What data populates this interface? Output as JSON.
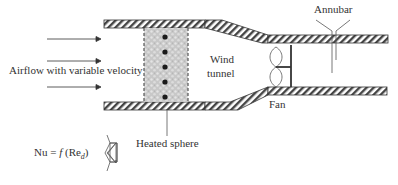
{
  "diagram": {
    "labels": {
      "airflow": "Airflow with variable velocity",
      "wind_tunnel_line1": "Wind",
      "wind_tunnel_line2": "tunnel",
      "annubar": "Annubar",
      "fan": "Fan",
      "heated_sphere": "Heated sphere",
      "equation_prefix": "Nu = ",
      "equation_f": "f",
      "equation_open": " (Re",
      "equation_sub": "d",
      "equation_close": ")"
    },
    "colors": {
      "stroke": "#333333",
      "hatch": "#444444",
      "sphere_bed": "#cfcfcf",
      "sphere_dot": "#1a1a1a"
    },
    "airflow_arrows": 3,
    "sphere_dots": 5
  }
}
